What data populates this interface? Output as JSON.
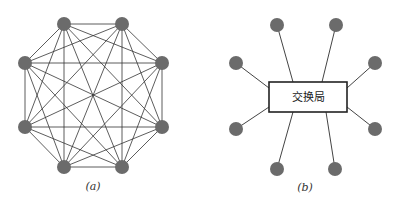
{
  "diagram_a": {
    "caption": "(a)",
    "type": "fully-connected mesh",
    "node_count": 8,
    "node_color": "#6b6b6b"
  },
  "diagram_b": {
    "caption": "(b)",
    "type": "star via central exchange",
    "node_count": 8,
    "center_label": "交换局",
    "node_color": "#6b6b6b"
  }
}
